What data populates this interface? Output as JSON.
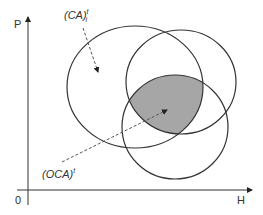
{
  "axes": {
    "y_label": "P",
    "x_label": "H",
    "origin_label": "0"
  },
  "labels": {
    "ca": {
      "base": "(CA)",
      "sup": "t",
      "sub": "i"
    },
    "oca": {
      "base": "(OCA)",
      "sup": "t"
    }
  },
  "colors": {
    "stroke": "#333333",
    "shaded_region": "#a6a6a6",
    "background": "#ffffff"
  }
}
